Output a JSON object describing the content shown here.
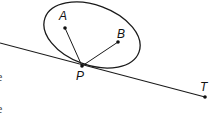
{
  "diagram": {
    "points": [
      {
        "label": "A",
        "x": 65,
        "y": 28,
        "lx": 59,
        "ly": 20
      },
      {
        "label": "B",
        "x": 118,
        "y": 42,
        "lx": 117,
        "ly": 37
      },
      {
        "label": "P",
        "x": 82,
        "y": 66,
        "lx": 76,
        "ly": 79
      },
      {
        "label": "T",
        "x": 205,
        "y": 97,
        "lx": 200,
        "ly": 90
      }
    ],
    "ellipse": {
      "cx": 92,
      "cy": 35,
      "rx": 50,
      "ry": 30,
      "rotation_deg": 20
    },
    "segments": [
      [
        "P",
        "A"
      ],
      [
        "P",
        "B"
      ]
    ],
    "line": {
      "from": [
        0,
        43
      ],
      "to": [
        205,
        97
      ],
      "label": "tangent through P to T"
    },
    "stroke_color": "#1a1a1a"
  },
  "cropped_text": {
    "line1": "e",
    "line2": "e"
  }
}
